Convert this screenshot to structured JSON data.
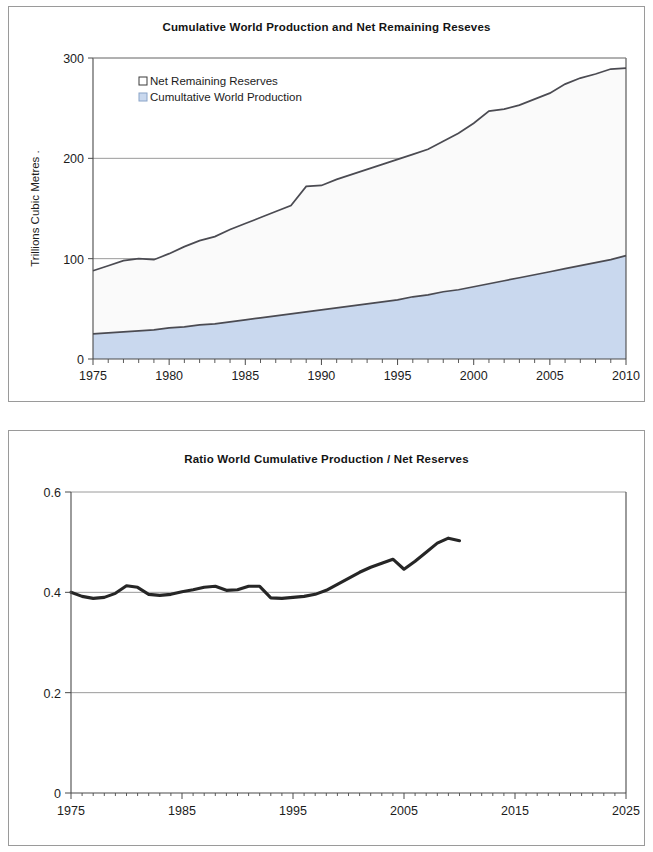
{
  "page": {
    "background_color": "#ffffff",
    "panel_border_color": "#9a9a9a"
  },
  "charts": {
    "top": {
      "title": "Cumulative World Production and Net Remaining Reseves",
      "legend": [
        {
          "label": "Net Remaining Reserves",
          "swatch_color": "#ffffff",
          "swatch_border": "#3a3a3a"
        },
        {
          "label": "Cumultative World Production",
          "swatch_color": "#c9d8ee",
          "swatch_border": "#8aa4c8"
        }
      ],
      "ylabel": "Trillions Cubic Metres  .",
      "ytick_labels": [
        "0",
        "100",
        "200",
        "300"
      ],
      "xtick_labels": [
        "1975",
        "1980",
        "1985",
        "1990",
        "1995",
        "2000",
        "2005",
        "2010"
      ]
    },
    "bottom": {
      "title": "Ratio World Cumulative  Production / Net Reserves",
      "ytick_labels": [
        "0",
        "0.2",
        "0.4",
        "0.6"
      ],
      "xtick_labels": [
        "1975",
        "1985",
        "1995",
        "2005",
        "2015",
        "2025"
      ]
    }
  },
  "chart_data": [
    {
      "type": "area",
      "id": "cumulative-production-and-net-reserves",
      "title": "Cumulative World Production and Net Remaining Reseves",
      "xlabel": "",
      "ylabel": "Trillions Cubic Metres",
      "xlim": [
        1975,
        2010
      ],
      "ylim": [
        0,
        300
      ],
      "yticks": [
        0,
        100,
        200,
        300
      ],
      "xticks": [
        1975,
        1980,
        1985,
        1990,
        1995,
        2000,
        2005,
        2010
      ],
      "x_minor_tick_interval": 1,
      "grid": "horizontal",
      "legend_position": "upper-left-inside",
      "stacked": true,
      "x": [
        1975,
        1976,
        1977,
        1978,
        1979,
        1980,
        1981,
        1982,
        1983,
        1984,
        1985,
        1986,
        1987,
        1988,
        1989,
        1990,
        1991,
        1992,
        1993,
        1994,
        1995,
        1996,
        1997,
        1998,
        1999,
        2000,
        2001,
        2002,
        2003,
        2004,
        2005,
        2006,
        2007,
        2008,
        2009,
        2010
      ],
      "series": [
        {
          "name": "Cumultative World Production",
          "fill_color": "#c9d8ee",
          "line_color": "#4b4b52",
          "values": [
            25,
            26,
            27,
            28,
            29,
            31,
            32,
            34,
            35,
            37,
            39,
            41,
            43,
            45,
            47,
            49,
            51,
            53,
            55,
            57,
            59,
            62,
            64,
            67,
            69,
            72,
            75,
            78,
            81,
            84,
            87,
            90,
            93,
            96,
            99,
            103
          ]
        },
        {
          "name": "Net Remaining Reserves",
          "fill_color": "#fafafa",
          "line_color": "#4b4b52",
          "values": [
            63,
            67,
            71,
            72,
            70,
            74,
            80,
            84,
            87,
            92,
            96,
            100,
            104,
            108,
            125,
            124,
            128,
            131,
            134,
            137,
            140,
            142,
            145,
            150,
            156,
            163,
            172,
            171,
            172,
            175,
            178,
            184,
            187,
            188,
            190,
            187
          ]
        }
      ],
      "totals_note": "Upper curve is the sum of production plus remaining reserves",
      "totals": [
        88,
        93,
        98,
        100,
        99,
        105,
        112,
        118,
        122,
        129,
        135,
        141,
        147,
        153,
        172,
        173,
        179,
        184,
        189,
        194,
        199,
        204,
        209,
        217,
        225,
        235,
        247,
        249,
        253,
        259,
        265,
        274,
        280,
        284,
        289,
        290
      ]
    },
    {
      "type": "line",
      "id": "ratio-cumulative-production-net-reserves",
      "title": "Ratio World Cumulative  Production / Net Reserves",
      "xlabel": "",
      "ylabel": "",
      "xlim": [
        1975,
        2025
      ],
      "ylim": [
        0,
        0.6
      ],
      "yticks": [
        0,
        0.2,
        0.4,
        0.6
      ],
      "xticks": [
        1975,
        1985,
        1995,
        2005,
        2015,
        2025
      ],
      "x_minor_tick_interval": 1,
      "grid": "horizontal",
      "legend_position": "none",
      "line_color": "#262626",
      "x": [
        1975,
        1976,
        1977,
        1978,
        1979,
        1980,
        1981,
        1982,
        1983,
        1984,
        1985,
        1986,
        1987,
        1988,
        1989,
        1990,
        1991,
        1992,
        1993,
        1994,
        1995,
        1996,
        1997,
        1998,
        1999,
        2000,
        2001,
        2002,
        2003,
        2004,
        2005,
        2006,
        2007,
        2008,
        2009,
        2010
      ],
      "values": [
        0.4,
        0.392,
        0.388,
        0.39,
        0.398,
        0.413,
        0.41,
        0.396,
        0.394,
        0.396,
        0.401,
        0.405,
        0.41,
        0.412,
        0.404,
        0.405,
        0.412,
        0.412,
        0.389,
        0.388,
        0.39,
        0.392,
        0.396,
        0.404,
        0.416,
        0.428,
        0.44,
        0.45,
        0.458,
        0.466,
        0.446,
        0.462,
        0.48,
        0.498,
        0.508,
        0.503
      ]
    }
  ]
}
